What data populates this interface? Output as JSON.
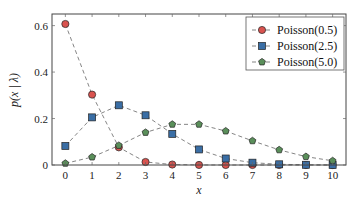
{
  "chart_data": {
    "type": "line",
    "title": "",
    "xlabel": "x",
    "ylabel": "p(x | λ)",
    "x": [
      0,
      1,
      2,
      3,
      4,
      5,
      6,
      7,
      8,
      9,
      10
    ],
    "xticks": [
      "0",
      "1",
      "2",
      "3",
      "4",
      "5",
      "6",
      "7",
      "8",
      "9",
      "10"
    ],
    "yticks": [
      "0",
      "0.2",
      "0.4",
      "0.6"
    ],
    "ytick_values": [
      0,
      0.2,
      0.4,
      0.6
    ],
    "xlim": [
      -0.5,
      10.5
    ],
    "ylim": [
      0,
      0.65
    ],
    "grid": false,
    "legend_position": "upper right",
    "series": [
      {
        "name": "Poisson(0.5)",
        "marker": "circle",
        "color": "#d9534f",
        "values": [
          0.607,
          0.303,
          0.076,
          0.013,
          0.002,
          0.0002,
          0.0,
          0.0,
          0.0,
          0.0,
          0.0
        ]
      },
      {
        "name": "Poisson(2.5)",
        "marker": "square",
        "color": "#3a6ea5",
        "values": [
          0.082,
          0.205,
          0.257,
          0.214,
          0.134,
          0.067,
          0.028,
          0.01,
          0.003,
          0.001,
          0.0002
        ]
      },
      {
        "name": "Poisson(5.0)",
        "marker": "pentagon",
        "color": "#5a8f5a",
        "values": [
          0.007,
          0.034,
          0.084,
          0.14,
          0.175,
          0.175,
          0.146,
          0.104,
          0.065,
          0.036,
          0.018
        ]
      }
    ]
  }
}
